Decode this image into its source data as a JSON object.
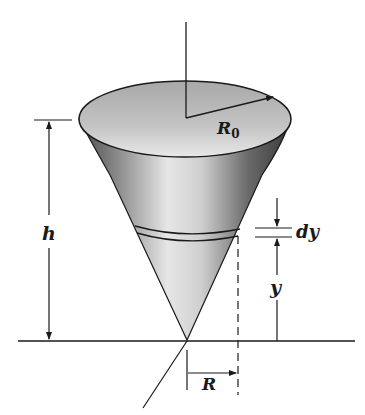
{
  "figure": {
    "type": "cone-volume-integration-diagram",
    "labels": {
      "top_radius": "R",
      "top_radius_subscript": "0",
      "height": "h",
      "slice_thickness": "dy",
      "slice_height": "y",
      "slice_radius": "R"
    },
    "colors": {
      "line": "#1a1a1a",
      "cone_dark": "#3a3a3a",
      "cone_mid": "#8a8a8a",
      "cone_light": "#e8e8e8",
      "top_face": "#b8b8b8"
    }
  }
}
